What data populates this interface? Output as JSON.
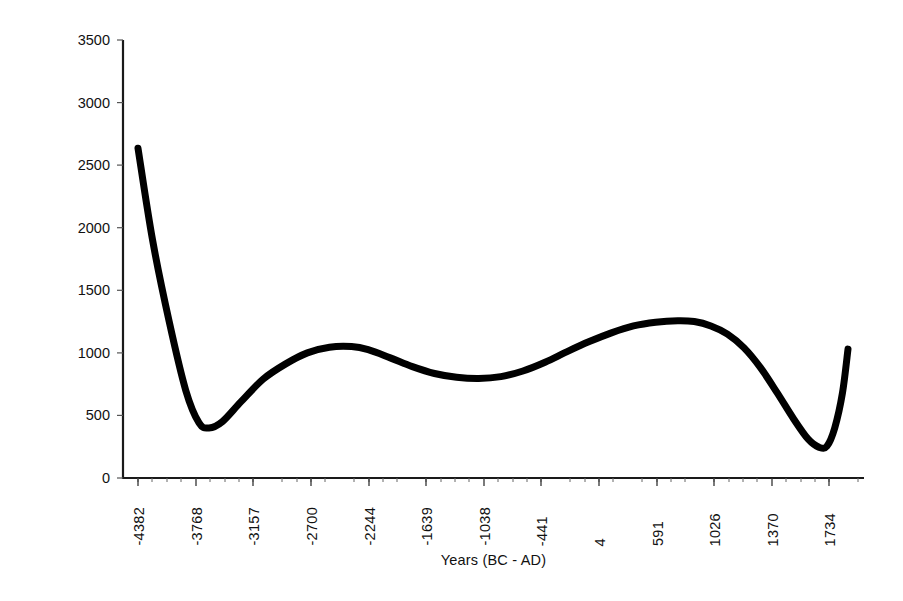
{
  "chart_data": {
    "type": "line",
    "title": "",
    "xlabel": "Years (BC - AD)",
    "ylabel": "Arboreal Pollen Count",
    "grid": false,
    "legend": null,
    "ylim": [
      0,
      3500
    ],
    "ytick_step": 500,
    "yticks": [
      "0",
      "500",
      "1000",
      "1500",
      "2000",
      "2500",
      "3000",
      "3500"
    ],
    "xticks": [
      "-4382",
      "-3768",
      "-3157",
      "-2700",
      "-2244",
      "-1639",
      "-1038",
      "-441",
      "4",
      "591",
      "1026",
      "1370",
      "1734"
    ],
    "categories": [
      "-4382",
      "-3768",
      "-3157",
      "-2700",
      "-2244",
      "-1639",
      "-1038",
      "-441",
      "4",
      "591",
      "1026",
      "1370",
      "1734"
    ],
    "series": [
      {
        "name": "Arboreal Pollen Count",
        "color": "#000000",
        "line_width": 7,
        "values": [
          2635,
          405,
          900,
          1045,
          960,
          820,
          880,
          1080,
          1200,
          1255,
          1050,
          560,
          245
        ]
      }
    ],
    "curve_points": [
      [
        -4382,
        2635
      ],
      [
        -4250,
        1900
      ],
      [
        -4100,
        1250
      ],
      [
        -3950,
        700
      ],
      [
        -3830,
        440
      ],
      [
        -3740,
        400
      ],
      [
        -3620,
        450
      ],
      [
        -3450,
        610
      ],
      [
        -3250,
        790
      ],
      [
        -3050,
        910
      ],
      [
        -2850,
        1000
      ],
      [
        -2650,
        1045
      ],
      [
        -2450,
        1050
      ],
      [
        -2300,
        1025
      ],
      [
        -2100,
        960
      ],
      [
        -1900,
        890
      ],
      [
        -1700,
        835
      ],
      [
        -1500,
        805
      ],
      [
        -1300,
        795
      ],
      [
        -1100,
        810
      ],
      [
        -900,
        855
      ],
      [
        -700,
        925
      ],
      [
        -500,
        1010
      ],
      [
        -300,
        1090
      ],
      [
        -100,
        1160
      ],
      [
        100,
        1215
      ],
      [
        300,
        1245
      ],
      [
        500,
        1257
      ],
      [
        650,
        1250
      ],
      [
        800,
        1215
      ],
      [
        950,
        1150
      ],
      [
        1100,
        1040
      ],
      [
        1250,
        880
      ],
      [
        1400,
        680
      ],
      [
        1550,
        470
      ],
      [
        1680,
        310
      ],
      [
        1780,
        245
      ],
      [
        1850,
        255
      ],
      [
        1920,
        400
      ],
      [
        1990,
        680
      ],
      [
        2040,
        1030
      ]
    ],
    "annotations": []
  },
  "axis": {
    "x_title": "Years (BC - AD)",
    "y_title": "Arboreal Pollen Count"
  }
}
